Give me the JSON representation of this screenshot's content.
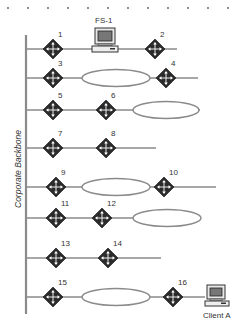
{
  "diagram": {
    "backbone_label": "Corporate Backbone",
    "server_label": "FS-1",
    "client_label": "Client A",
    "colors": {
      "line": "#8a8a8a",
      "backbone": "#8a8a8a",
      "router_fill": "#2b2b2b",
      "router_arrows": "#ffffff",
      "ellipse_stroke": "#8a8a8a",
      "label": "#333333"
    },
    "dots_x": [
      8,
      28,
      48,
      68,
      88,
      108,
      128,
      148,
      168,
      188,
      208,
      228
    ],
    "rows": [
      {
        "y": 49,
        "end": 177,
        "routers": [
          {
            "id": "1",
            "x": 53
          },
          {
            "id": "2",
            "x": 155
          }
        ],
        "ellipse": null,
        "device": "FS-1"
      },
      {
        "y": 78,
        "end": 198,
        "routers": [
          {
            "id": "3",
            "x": 53
          },
          {
            "id": "4",
            "x": 166
          }
        ],
        "ellipse": {
          "cx": 116,
          "rx": 34
        }
      },
      {
        "y": 110,
        "end": 200,
        "routers": [
          {
            "id": "5",
            "x": 53
          },
          {
            "id": "6",
            "x": 106
          }
        ],
        "ellipse": {
          "cx": 166,
          "rx": 33
        }
      },
      {
        "y": 148,
        "end": 156,
        "routers": [
          {
            "id": "7",
            "x": 53
          },
          {
            "id": "8",
            "x": 106
          }
        ],
        "ellipse": null
      },
      {
        "y": 187,
        "end": 216,
        "routers": [
          {
            "id": "9",
            "x": 56
          },
          {
            "id": "10",
            "x": 164
          }
        ],
        "ellipse": {
          "cx": 116,
          "rx": 34
        }
      },
      {
        "y": 218,
        "end": 200,
        "routers": [
          {
            "id": "11",
            "x": 56
          },
          {
            "id": "12",
            "x": 102
          }
        ],
        "ellipse": {
          "cx": 167,
          "rx": 34
        }
      },
      {
        "y": 258,
        "end": 161,
        "routers": [
          {
            "id": "13",
            "x": 56
          },
          {
            "id": "14",
            "x": 108
          }
        ],
        "ellipse": null
      },
      {
        "y": 297,
        "end": 205,
        "routers": [
          {
            "id": "15",
            "x": 53
          },
          {
            "id": "16",
            "x": 173
          }
        ],
        "ellipse": {
          "cx": 116,
          "rx": 34
        },
        "device": "Client A"
      }
    ]
  }
}
